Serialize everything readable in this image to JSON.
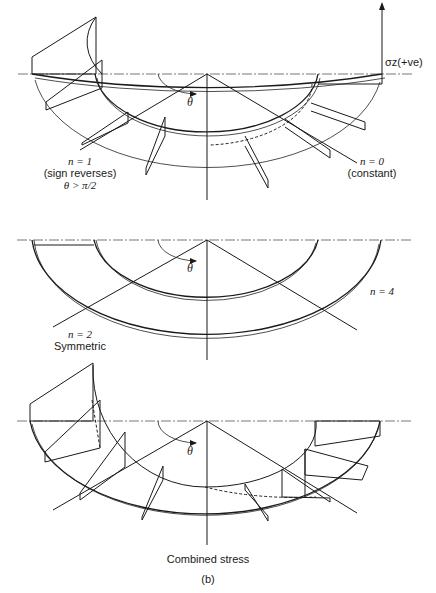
{
  "figure": {
    "caption": "(b)",
    "panels": [
      {
        "id": "top",
        "axis_label": "σz(+ve)",
        "angle_symbol": "θ",
        "labels": [
          {
            "line1": "n = 1",
            "line2": "(sign reverses)",
            "line3": "θ > π/2"
          },
          {
            "line1": "n = 0",
            "line2": "(constant)"
          }
        ]
      },
      {
        "id": "middle",
        "angle_symbol": "θ",
        "labels": [
          {
            "line1": "n = 2",
            "line2": "Symmetric"
          },
          {
            "line1": "n = 4"
          }
        ]
      },
      {
        "id": "bottom",
        "angle_symbol": "θ",
        "title": "Combined stress"
      }
    ]
  }
}
